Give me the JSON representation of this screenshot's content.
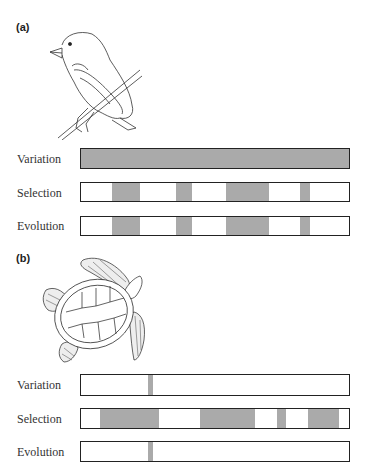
{
  "panels": [
    {
      "label": "(a)",
      "illustration": "finch-bird-illustration",
      "rows": [
        {
          "label": "Variation",
          "full": true,
          "segments": []
        },
        {
          "label": "Selection",
          "full": false,
          "segments": [
            [
              112,
              140
            ],
            [
              176,
              192
            ],
            [
              226,
              269
            ],
            [
              300,
              310
            ]
          ]
        },
        {
          "label": "Evolution",
          "full": false,
          "segments": [
            [
              112,
              140
            ],
            [
              176,
              192
            ],
            [
              226,
              269
            ],
            [
              300,
              310
            ]
          ]
        }
      ]
    },
    {
      "label": "(b)",
      "illustration": "sea-turtle-illustration",
      "rows": [
        {
          "label": "Variation",
          "full": false,
          "segments": [
            [
              147,
              152
            ]
          ]
        },
        {
          "label": "Selection",
          "full": false,
          "segments": [
            [
              100,
              159
            ],
            [
              200,
              255
            ],
            [
              277,
              286
            ],
            [
              308,
              339
            ]
          ]
        },
        {
          "label": "Evolution",
          "full": false,
          "segments": [
            [
              147,
              152
            ]
          ]
        }
      ]
    }
  ],
  "colors": {
    "fill": "#aaaaaa",
    "outline": "#222222"
  }
}
